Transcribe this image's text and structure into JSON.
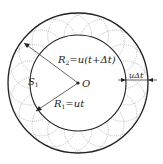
{
  "diagram": {
    "center_label": "O",
    "region_label": "S",
    "region_subscript": "1",
    "outer_radius_label": {
      "name": "R",
      "sub": "2",
      "expr": "=u(t+Δt)"
    },
    "inner_radius_label": {
      "name": "R",
      "sub": "1",
      "expr": "=ut"
    },
    "thickness_label": "uΔt",
    "colors": {
      "stroke": "#222222",
      "dotted": "#999999"
    }
  }
}
